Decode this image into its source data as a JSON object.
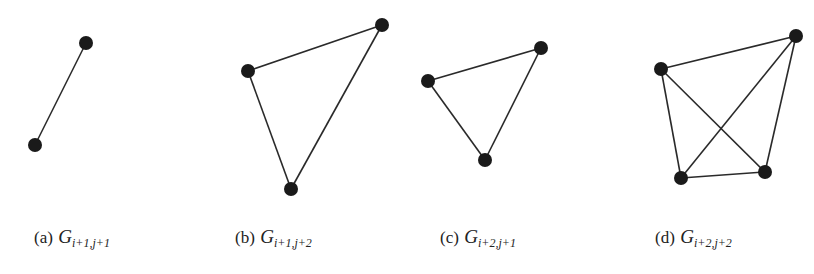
{
  "figure": {
    "panels": [
      {
        "id": "a",
        "label": "(a)",
        "graph_symbol": "G",
        "subscript": "i+1,j+1",
        "caption_x": 34,
        "nodes": [
          [
            86,
            43
          ],
          [
            35,
            145
          ]
        ],
        "edges": [
          [
            0,
            1
          ]
        ]
      },
      {
        "id": "b",
        "label": "(b)",
        "graph_symbol": "G",
        "subscript": "i+1,j+2",
        "caption_x": 235,
        "nodes": [
          [
            248,
            71
          ],
          [
            382,
            25
          ],
          [
            291,
            189
          ]
        ],
        "edges": [
          [
            0,
            1
          ],
          [
            0,
            2
          ],
          [
            1,
            2
          ]
        ]
      },
      {
        "id": "c",
        "label": "(c)",
        "graph_symbol": "G",
        "subscript": "i+2,j+1",
        "caption_x": 440,
        "nodes": [
          [
            428,
            81
          ],
          [
            541,
            48
          ],
          [
            485,
            160
          ]
        ],
        "edges": [
          [
            0,
            1
          ],
          [
            0,
            2
          ],
          [
            1,
            2
          ]
        ]
      },
      {
        "id": "d",
        "label": "(d)",
        "graph_symbol": "G",
        "subscript": "i+2,j+2",
        "caption_x": 655,
        "nodes": [
          [
            661,
            69
          ],
          [
            796,
            36
          ],
          [
            681,
            178
          ],
          [
            765,
            172
          ]
        ],
        "edges": [
          [
            0,
            1
          ],
          [
            0,
            2
          ],
          [
            0,
            3
          ],
          [
            1,
            2
          ],
          [
            1,
            3
          ],
          [
            2,
            3
          ]
        ]
      }
    ],
    "colors": {
      "node": "#1a1a1a",
      "edge": "#2a2a2a"
    }
  }
}
